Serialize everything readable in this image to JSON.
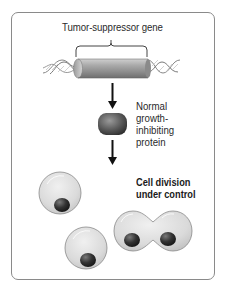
{
  "diagram": {
    "gene_label": "Tumor-suppressor gene",
    "protein_label_lines": [
      "Normal",
      "growth-",
      "inhibiting",
      "protein"
    ],
    "division_label_lines": [
      "Cell division",
      "under control"
    ],
    "flow": [
      "tumor-suppressor-gene",
      "normal-growth-inhibiting-protein",
      "controlled-cell-division"
    ],
    "colors": {
      "border": "#8a8a8a",
      "text": "#2a2a2a",
      "cell_fill": "#d9d9d9",
      "nucleus": "#333333",
      "gene_cylinder": "#9a9a9a",
      "protein": "#555555",
      "arrow": "#111111"
    }
  }
}
